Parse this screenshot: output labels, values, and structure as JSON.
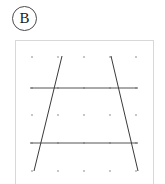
{
  "panel": {
    "label": "B",
    "label_icon": "circled-letter-badge"
  },
  "figure": {
    "frame": {
      "x": 15,
      "y": 40,
      "width": 139,
      "height": 148,
      "border_color": "#d8d8d8"
    },
    "background_color": "#ffffff",
    "dot_color": "#b9b9b9",
    "horizontal_line_color": "#555555",
    "slant_line_color": "#3a3a3a"
  },
  "chart_data": {
    "type": "scatter",
    "title": "",
    "subtitle": "",
    "xlabel": "",
    "ylabel": "",
    "xlim": [
      0,
      137
    ],
    "ylim": [
      0,
      146
    ],
    "grid": true,
    "legend": "none",
    "dot_grid": {
      "columns": 5,
      "rows": 5,
      "x": [
        16,
        42,
        68,
        94,
        120
      ],
      "y": [
        16,
        47,
        74,
        102,
        130
      ],
      "radius": 1.1
    },
    "series": [
      {
        "name": "transversal-line-upper",
        "type": "line",
        "x": [
          14,
          122
        ],
        "y": [
          47,
          47
        ]
      },
      {
        "name": "transversal-line-lower",
        "type": "line",
        "x": [
          14,
          122
        ],
        "y": [
          102,
          102
        ]
      },
      {
        "name": "slant-line-left",
        "type": "line",
        "x": [
          46,
          18
        ],
        "y": [
          15,
          130
        ]
      },
      {
        "name": "slant-line-right",
        "type": "line",
        "x": [
          95,
          122
        ],
        "y": [
          15,
          130
        ]
      }
    ]
  }
}
